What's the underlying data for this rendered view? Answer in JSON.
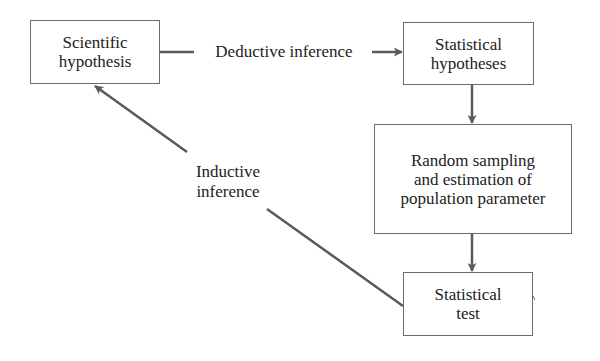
{
  "diagram": {
    "nodes": [
      {
        "id": "scientific-hypothesis",
        "lines": [
          "Scientific",
          "hypothesis"
        ]
      },
      {
        "id": "statistical-hypotheses",
        "lines": [
          "Statistical",
          "hypotheses"
        ]
      },
      {
        "id": "random-sampling",
        "lines": [
          "Random sampling",
          "and estimation of",
          "population parameter"
        ]
      },
      {
        "id": "statistical-test",
        "lines": [
          "Statistical",
          "test"
        ]
      }
    ],
    "edges": [
      {
        "from": "scientific-hypothesis",
        "to": "statistical-hypotheses",
        "label": "Deductive inference"
      },
      {
        "from": "statistical-hypotheses",
        "to": "random-sampling",
        "label": ""
      },
      {
        "from": "random-sampling",
        "to": "statistical-test",
        "label": ""
      },
      {
        "from": "statistical-test",
        "to": "scientific-hypothesis",
        "label_lines": [
          "Inductive",
          "inference"
        ]
      }
    ],
    "colors": {
      "line": "#5a5a5a",
      "border": "#6a6a6a",
      "text": "#222222",
      "background": "#ffffff"
    }
  }
}
